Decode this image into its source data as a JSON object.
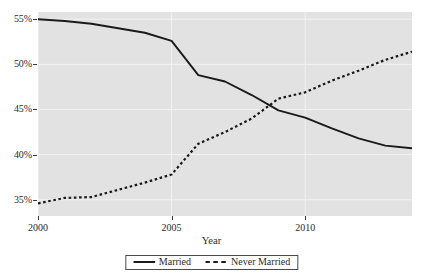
{
  "chart_data": {
    "type": "line",
    "title": "",
    "subtitle": "",
    "xlabel": "Year",
    "ylabel": "",
    "xlim": [
      2000,
      2014
    ],
    "ylim": [
      33.2,
      55.8
    ],
    "grid": true,
    "grid_color": "#f2f2f2",
    "panel_background": "#e2e2e2",
    "legend_position": "bottom-center",
    "x": [
      2000,
      2001,
      2002,
      2003,
      2004,
      2005,
      2006,
      2007,
      2008,
      2009,
      2010,
      2011,
      2012,
      2013,
      2014
    ],
    "xticks": [
      2000,
      2005,
      2010
    ],
    "xtick_labels": [
      "2000",
      "2005",
      "2010"
    ],
    "yticks": [
      35,
      40,
      45,
      50,
      55
    ],
    "ytick_labels": [
      "35%",
      "40%",
      "45%",
      "50%",
      "55%"
    ],
    "series": [
      {
        "name": "Married",
        "style": "solid",
        "color": "#1a1a1a",
        "values": [
          55.0,
          54.8,
          54.5,
          54.0,
          53.5,
          52.6,
          48.8,
          48.1,
          46.6,
          44.9,
          44.1,
          42.9,
          41.8,
          41.0,
          40.7
        ]
      },
      {
        "name": "Never Married",
        "style": "dashed",
        "color": "#1a1a1a",
        "values": [
          34.6,
          35.2,
          35.3,
          36.1,
          36.9,
          37.8,
          41.2,
          42.5,
          44.0,
          46.2,
          46.9,
          48.2,
          49.3,
          50.5,
          51.4
        ]
      }
    ],
    "annotations": []
  },
  "axis": {
    "x_title": "Year"
  },
  "legend": {
    "items": [
      {
        "label": "Married",
        "style": "solid"
      },
      {
        "label": "Never Married",
        "style": "dashed"
      }
    ]
  }
}
